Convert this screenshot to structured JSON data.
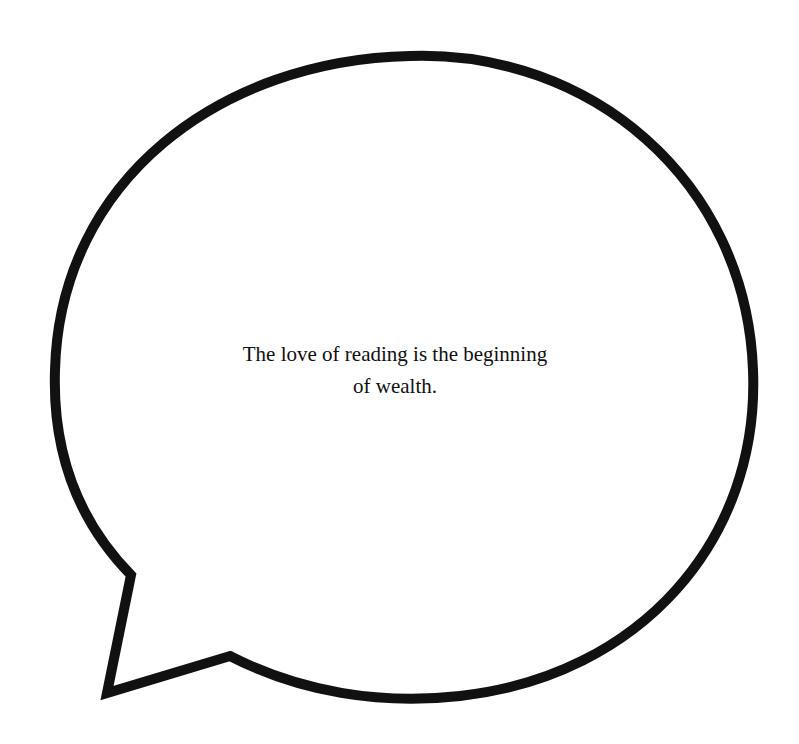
{
  "bubble": {
    "type": "speech-bubble",
    "stroke_color": "#111111",
    "fill_color": "#ffffff",
    "background_color": "#ffffff",
    "tail_direction": "bottom-left"
  },
  "quote": {
    "lines": [
      "The love of reading is the beginning",
      "of wealth."
    ]
  }
}
